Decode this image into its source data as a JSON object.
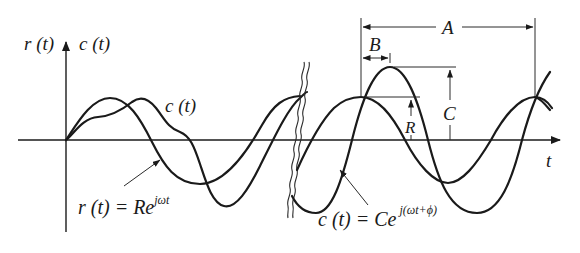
{
  "diagram": {
    "axes": {
      "y_label_r": "r (t)",
      "y_label_c": "c (t)",
      "x_label": "t"
    },
    "curves": {
      "output_label": "c (t)",
      "input_equation": {
        "lhs": "r (t) = Re",
        "exponent": "jωt"
      },
      "output_equation": {
        "lhs": "c (t) = Ce",
        "exponent": "j(ωt+ϕ)"
      }
    },
    "dimensions": {
      "A": "A",
      "B": "B",
      "C": "C",
      "R": "R"
    },
    "geometry": {
      "origin": [
        66,
        140
      ],
      "x_axis_end": 562,
      "y_axis_top": 40,
      "break_x": 297,
      "R_amplitude_px": 43,
      "C_amplitude_px": 73,
      "period_px": 174,
      "R_peak_x": 361,
      "C_peak_x": 390,
      "stroke_color": "#1a1a1a"
    }
  }
}
